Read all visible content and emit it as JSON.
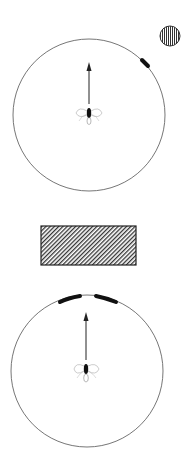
{
  "diagram": {
    "panels": [
      {
        "name": "top-panel",
        "stimulus": "circular striped light source (vertical stripes)",
        "arena": "circular arena",
        "orientation_arc_count": 1,
        "direction": "up"
      },
      {
        "name": "bottom-panel",
        "stimulus": "rectangular hatched light source (diagonal hatching)",
        "arena": "circular arena",
        "orientation_arc_count": 2,
        "direction": "up"
      }
    ],
    "colors": {
      "line": "#555555",
      "ink": "#111111",
      "background": "#ffffff"
    }
  }
}
